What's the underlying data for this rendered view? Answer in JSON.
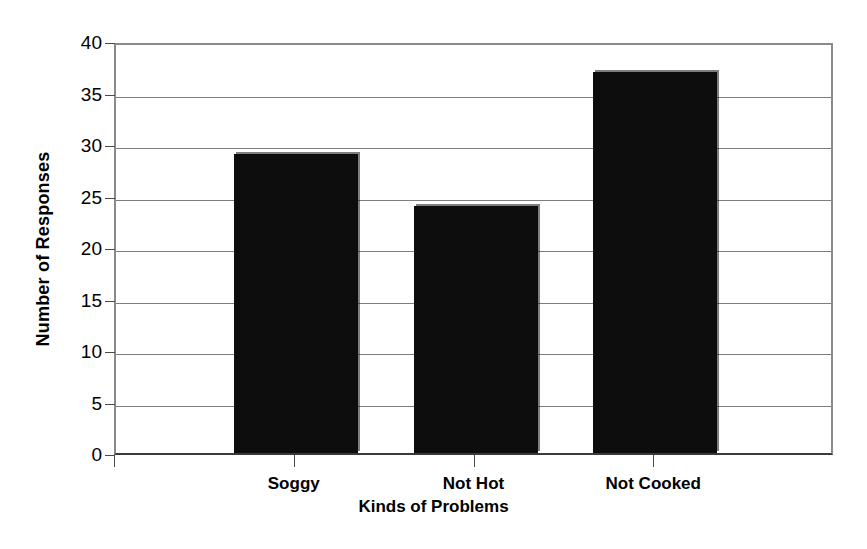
{
  "chart_data": {
    "type": "bar",
    "title": "",
    "categories": [
      "Soggy",
      "Not Hot",
      "Not Cooked"
    ],
    "values": [
      29,
      24,
      37
    ],
    "series": [
      {
        "name": "Number of Responses",
        "values": [
          29,
          24,
          37
        ]
      }
    ],
    "xlabel": "Kinds of Problems",
    "ylabel": "Number of Responses",
    "ylim": [
      0,
      40
    ],
    "ytick_labels": [
      "0",
      "5",
      "10",
      "15",
      "20",
      "25",
      "30",
      "35",
      "40"
    ],
    "ytick_values": [
      0,
      5,
      10,
      15,
      20,
      25,
      30,
      35,
      40
    ],
    "grid": "horizontal",
    "legend": "none",
    "bar_color": "#0d0d0d",
    "gridline_color": "#7d7d7d",
    "axis_color": "#3a3a3a",
    "background_color": "#ffffff"
  }
}
